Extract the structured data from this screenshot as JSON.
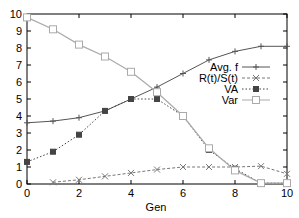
{
  "chart_data": {
    "type": "line",
    "title": "",
    "xlabel": "Gen",
    "ylabel": "",
    "xlim": [
      0,
      10
    ],
    "ylim": [
      0,
      10
    ],
    "x_ticks": [
      0,
      2,
      4,
      6,
      8,
      10
    ],
    "y_ticks": [
      0,
      1,
      2,
      3,
      4,
      5,
      6,
      7,
      8,
      9,
      10
    ],
    "grid": false,
    "legend_position": "right-center",
    "series": [
      {
        "name": "Avg. f",
        "style": "solid",
        "marker": "plus",
        "color": "#555555",
        "x": [
          0,
          1,
          2,
          3,
          4,
          5,
          6,
          7,
          8,
          9,
          10
        ],
        "values": [
          3.6,
          3.7,
          3.9,
          4.3,
          5.0,
          5.7,
          6.5,
          7.3,
          7.8,
          8.1,
          8.1
        ]
      },
      {
        "name": "R(t)/S(t)",
        "style": "dashed",
        "marker": "cross",
        "color": "#777777",
        "x": [
          1,
          2,
          3,
          4,
          5,
          6,
          7,
          8,
          9,
          10
        ],
        "values": [
          0.1,
          0.25,
          0.45,
          0.65,
          0.85,
          1.0,
          1.0,
          1.0,
          1.05,
          0.6
        ]
      },
      {
        "name": "VA",
        "style": "dotted",
        "marker": "asterisk-box",
        "color": "#444444",
        "x": [
          0,
          1,
          2,
          3,
          4,
          5,
          6,
          7,
          8,
          9,
          10
        ],
        "values": [
          1.3,
          1.9,
          2.9,
          4.3,
          5.0,
          5.0,
          4.0,
          2.0,
          0.9,
          0.05,
          0.05
        ]
      },
      {
        "name": "Var",
        "style": "solid-light",
        "marker": "square",
        "color": "#aaaaaa",
        "x": [
          0,
          1,
          2,
          3,
          4,
          5,
          6,
          7,
          8,
          9,
          10
        ],
        "values": [
          9.8,
          9.1,
          8.2,
          7.5,
          6.6,
          5.4,
          4.0,
          2.1,
          0.8,
          0.05,
          0.05
        ]
      }
    ]
  }
}
